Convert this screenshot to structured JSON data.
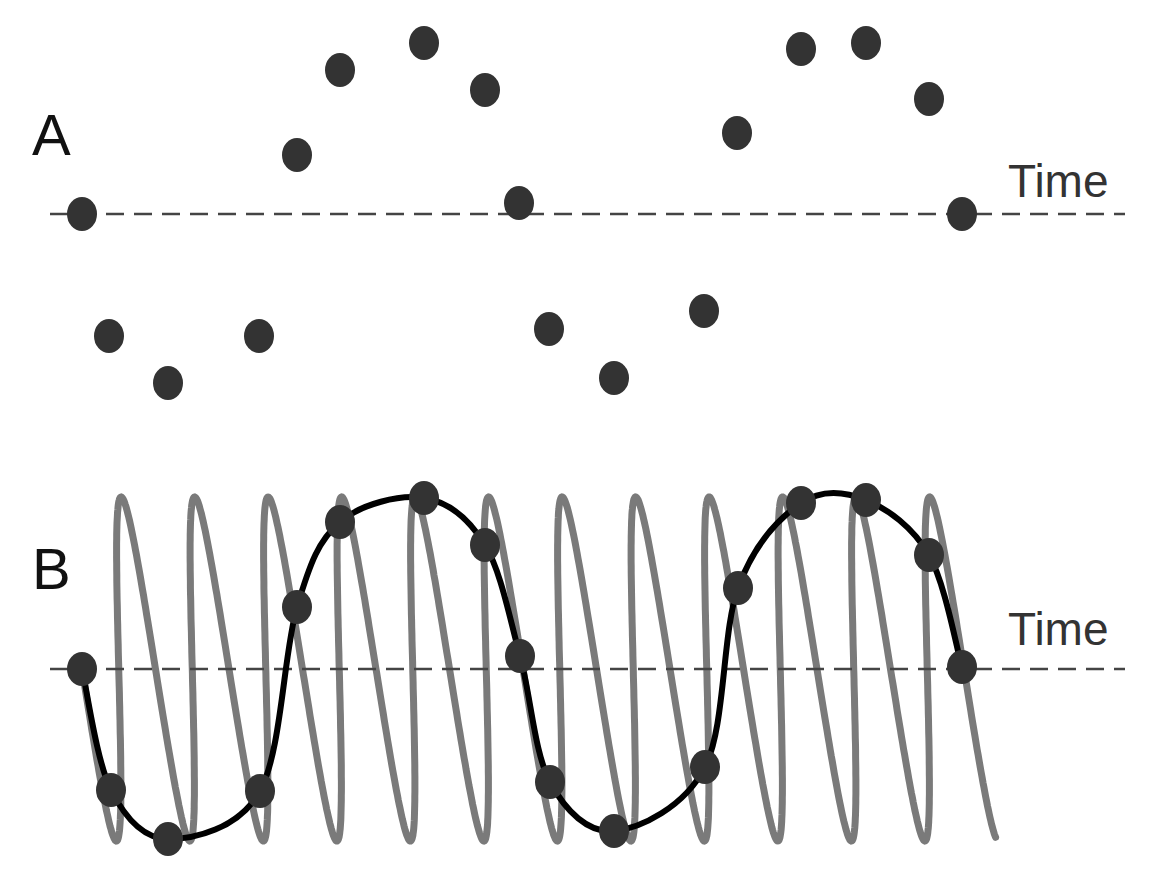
{
  "panels": [
    {
      "id": "A",
      "label": "A",
      "axis_label": "Time",
      "baseline_y": 214,
      "samples": [
        [
          82,
          214
        ],
        [
          109,
          336
        ],
        [
          168,
          383
        ],
        [
          259,
          336
        ],
        [
          297,
          155
        ],
        [
          340,
          70
        ],
        [
          424,
          43
        ],
        [
          485,
          90
        ],
        [
          519,
          203
        ],
        [
          549,
          329
        ],
        [
          614,
          378
        ],
        [
          704,
          311
        ],
        [
          737,
          133
        ],
        [
          801,
          49
        ],
        [
          866,
          43
        ],
        [
          929,
          99
        ],
        [
          962,
          214
        ]
      ]
    },
    {
      "id": "B",
      "label": "B",
      "axis_label": "Time",
      "baseline_y": 669,
      "samples": [
        [
          82,
          669
        ],
        [
          111,
          790
        ],
        [
          168,
          839
        ],
        [
          260,
          791
        ],
        [
          297,
          607
        ],
        [
          340,
          522
        ],
        [
          424,
          498
        ],
        [
          485,
          545
        ],
        [
          520,
          656
        ],
        [
          550,
          782
        ],
        [
          614,
          831
        ],
        [
          705,
          767
        ],
        [
          738,
          588
        ],
        [
          801,
          503
        ],
        [
          866,
          500
        ],
        [
          929,
          555
        ],
        [
          962,
          667
        ]
      ],
      "high_freq_signal": {
        "color": "#7a7a7a",
        "x_start": 82,
        "x_end": 980,
        "center_y": 666,
        "amplitude": 172,
        "cycle_px": 73.5
      },
      "alias_curve_color": "#000000"
    }
  ],
  "style": {
    "dot_color": "#333333",
    "dot_rx": 15,
    "dot_ry": 17,
    "dash_color": "#444444",
    "axis_x_start": 50,
    "axis_x_end": 1125
  }
}
